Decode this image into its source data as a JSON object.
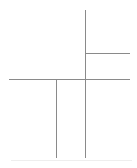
{
  "document": {
    "kind": "page-layout-wireframe",
    "title": "",
    "canvas_width": "137",
    "canvas_height": "168"
  },
  "colors": {
    "background": "#ffffff",
    "line": "#8a8a8a",
    "panel_fill": "#ffffff",
    "shadow": "#eeeeee"
  },
  "frame": {
    "x": "9",
    "y": "10",
    "width": "121",
    "height": "148",
    "stroke_width": "1.3"
  },
  "regions": {
    "upper": {
      "name": "upper-region",
      "label": "",
      "panels": [
        {
          "name": "panel-upper-left",
          "label": "",
          "x": "9",
          "y": "10",
          "width": "76",
          "height": "69"
        },
        {
          "name": "panel-upper-right-top",
          "label": "",
          "x": "85",
          "y": "10",
          "width": "45",
          "height": "43"
        },
        {
          "name": "panel-upper-right-bottom",
          "label": "",
          "x": "85",
          "y": "53",
          "width": "45",
          "height": "26"
        }
      ]
    },
    "lower": {
      "name": "lower-region",
      "label": "",
      "panels": [
        {
          "name": "panel-lower-left",
          "label": "",
          "x": "9",
          "y": "79",
          "width": "47",
          "height": "79"
        },
        {
          "name": "panel-lower-middle",
          "label": "",
          "x": "56",
          "y": "79",
          "width": "29",
          "height": "79"
        },
        {
          "name": "panel-lower-right",
          "label": "",
          "x": "85",
          "y": "79",
          "width": "45",
          "height": "79"
        }
      ]
    }
  },
  "dividers": {
    "horizontal": [
      {
        "name": "divider-main-horizontal",
        "label": "",
        "x": "9",
        "y": "79",
        "length": "121"
      },
      {
        "name": "divider-right-column-horizontal",
        "label": "",
        "x": "85",
        "y": "53",
        "length": "45"
      }
    ],
    "vertical": [
      {
        "name": "divider-upper-vertical",
        "label": "",
        "x": "85",
        "y": "10",
        "length": "69"
      },
      {
        "name": "divider-lower-vertical-left",
        "label": "",
        "x": "56",
        "y": "79",
        "length": "79"
      },
      {
        "name": "divider-lower-vertical-right",
        "label": "",
        "x": "85",
        "y": "79",
        "length": "79"
      }
    ]
  }
}
